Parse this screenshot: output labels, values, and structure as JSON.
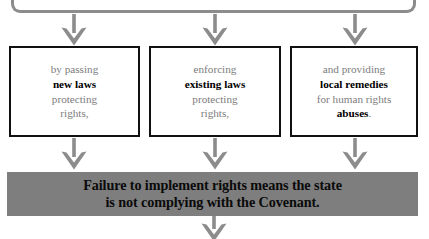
{
  "diagram": {
    "colors": {
      "arrow": "#8c8c8c",
      "bracket": "#8c8c8c",
      "box_border": "#111111",
      "banner_background": "#7e7e7e",
      "muted_text": "#7d7d7d",
      "emphasis_text": "#000000",
      "page_background": "#ffffff"
    },
    "connector": {
      "name": "top-bracket",
      "shape": "rounded-bracket-bottom"
    },
    "boxes": [
      {
        "id": "box-new-laws",
        "lines": [
          {
            "text": "by passing",
            "emphasis": false
          },
          {
            "text": "new laws",
            "emphasis": true
          },
          {
            "text": "protecting",
            "emphasis": false
          },
          {
            "text": "rights,",
            "emphasis": false
          }
        ]
      },
      {
        "id": "box-existing-laws",
        "lines": [
          {
            "text": "enforcing",
            "emphasis": false
          },
          {
            "text": "existing laws",
            "emphasis": true
          },
          {
            "text": "protecting",
            "emphasis": false
          },
          {
            "text": "rights,",
            "emphasis": false
          }
        ]
      },
      {
        "id": "box-local-remedies",
        "lines": [
          {
            "text": "and providing",
            "emphasis": false
          },
          {
            "text": "local remedies",
            "emphasis": true
          },
          {
            "text": "for human rights",
            "emphasis": false
          },
          {
            "text": "abuses",
            "emphasis": true,
            "suffix": "."
          }
        ]
      }
    ],
    "banner": {
      "id": "banner-failure-statement",
      "line1": "Failure to implement rights means the state",
      "line2": "is not complying with the Covenant."
    },
    "arrows": {
      "top_row": [
        {
          "name": "arrow-down-to-new-laws"
        },
        {
          "name": "arrow-down-to-existing-laws"
        },
        {
          "name": "arrow-down-to-local-remedies"
        }
      ],
      "middle_row": [
        {
          "name": "arrow-down-from-new-laws"
        },
        {
          "name": "arrow-down-from-existing-laws"
        },
        {
          "name": "arrow-down-from-local-remedies"
        }
      ],
      "bottom": {
        "name": "arrow-down-from-banner"
      }
    }
  }
}
